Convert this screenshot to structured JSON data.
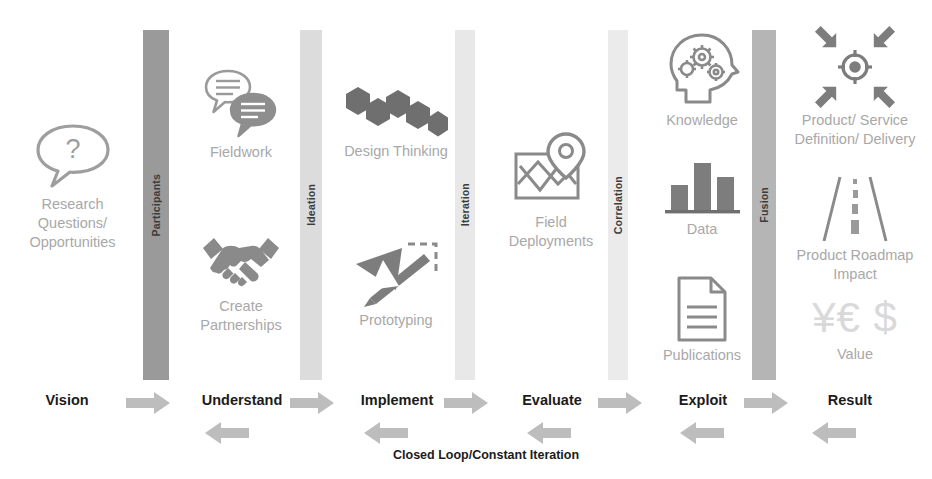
{
  "diagram": {
    "loop_label": "Closed Loop/Constant Iteration",
    "colors": {
      "bar_dark": "#9a9a9a",
      "bar_mid": "#b3b3b3",
      "bar_light": "#d8d8d8",
      "bar_lightest": "#e6e6e6",
      "icon_gray": "#8c8c8c",
      "icon_fill": "#7a7a7a",
      "caption_gray": "#a8a8a8",
      "arrow_gray": "#bdbdbd",
      "text_dark": "#1b1b1b"
    }
  },
  "gates": [
    {
      "label": "Participants",
      "shade": "dark"
    },
    {
      "label": "Ideation",
      "shade": "light"
    },
    {
      "label": "Iteration",
      "shade": "lightest"
    },
    {
      "label": "Correlation",
      "shade": "lightest"
    },
    {
      "label": "Fusion",
      "shade": "mid"
    }
  ],
  "stages": [
    {
      "name": "Vision",
      "nodes": [
        {
          "caption": "Research Questions/ Opportunities",
          "icon": "question-speech-bubble-icon"
        }
      ]
    },
    {
      "name": "Understand",
      "nodes": [
        {
          "caption": "Fieldwork",
          "icon": "two-speech-bubbles-icon"
        },
        {
          "caption": "Create Partnerships",
          "icon": "handshake-icon"
        }
      ]
    },
    {
      "name": "Implement",
      "nodes": [
        {
          "caption": "Design Thinking",
          "icon": "hexagons-icon"
        },
        {
          "caption": "Prototyping",
          "icon": "ruler-pencil-icon"
        }
      ]
    },
    {
      "name": "Evaluate",
      "nodes": [
        {
          "caption": "Field Deployments",
          "icon": "map-pin-icon"
        }
      ]
    },
    {
      "name": "Exploit",
      "nodes": [
        {
          "caption": "Knowledge",
          "icon": "brain-gears-icon"
        },
        {
          "caption": "Data",
          "icon": "bar-chart-icon"
        },
        {
          "caption": "Publications",
          "icon": "document-icon"
        }
      ]
    },
    {
      "name": "Result",
      "nodes": [
        {
          "caption": "Product/ Service Definition/ Delivery",
          "icon": "target-converging-arrows-icon"
        },
        {
          "caption": "Product Roadmap Impact",
          "icon": "road-icon"
        },
        {
          "caption": "Value",
          "icon": "currency-symbols-icon"
        }
      ]
    }
  ],
  "forward_arrows": [
    {
      "from": "Vision",
      "to": "Understand"
    },
    {
      "from": "Understand",
      "to": "Implement"
    },
    {
      "from": "Implement",
      "to": "Evaluate"
    },
    {
      "from": "Evaluate",
      "to": "Exploit"
    },
    {
      "from": "Exploit",
      "to": "Result"
    }
  ],
  "back_arrows": [
    {
      "from": "Understand",
      "to": "Vision"
    },
    {
      "from": "Implement",
      "to": "Understand"
    },
    {
      "from": "Evaluate",
      "to": "Implement"
    },
    {
      "from": "Exploit",
      "to": "Evaluate"
    },
    {
      "from": "Result",
      "to": "Exploit"
    }
  ]
}
